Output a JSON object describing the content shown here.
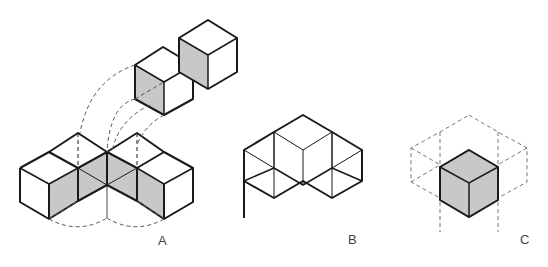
{
  "figures": [
    {
      "id": "A",
      "label": "A",
      "description": "L-shaped arrangement of cubes with two floating cubes and dashed rotation arrows"
    },
    {
      "id": "B",
      "label": "B",
      "description": "Three cubes forming a hexagonal star pattern"
    },
    {
      "id": "C",
      "label": "C",
      "description": "Single shaded cube inside dashed hexagonal grid"
    }
  ],
  "colors": {
    "stroke": "#1a1a1a",
    "shade": "#c8c8c8",
    "dash": "#555555"
  }
}
